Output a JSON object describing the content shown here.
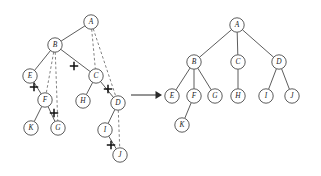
{
  "figure": {
    "background_color": "#ffffff",
    "node_stroke_color": "#4a4a4a",
    "dashed_edge_color": "#6b6b6b",
    "cut_mark_color": "#111111",
    "arrow_color": "#2a2a2a",
    "node_radius": 7.2
  },
  "arrow": {
    "label": "",
    "x1": 131,
    "y1": 95,
    "x2": 162,
    "y2": 95
  },
  "left_tree": {
    "name": "left-tree",
    "nodes": [
      {
        "id": "A",
        "label": "A",
        "x": 91,
        "y": 22
      },
      {
        "id": "B",
        "label": "B",
        "x": 55,
        "y": 45
      },
      {
        "id": "C",
        "label": "C",
        "x": 96,
        "y": 76
      },
      {
        "id": "D",
        "label": "D",
        "x": 118,
        "y": 103
      },
      {
        "id": "E",
        "label": "E",
        "x": 30,
        "y": 76
      },
      {
        "id": "F",
        "label": "F",
        "x": 45,
        "y": 100
      },
      {
        "id": "G",
        "label": "G",
        "x": 58,
        "y": 128
      },
      {
        "id": "H",
        "label": "H",
        "x": 83,
        "y": 101
      },
      {
        "id": "I",
        "label": "I",
        "x": 105,
        "y": 130
      },
      {
        "id": "J",
        "label": "J",
        "x": 120,
        "y": 155
      },
      {
        "id": "K",
        "label": "K",
        "x": 31,
        "y": 128
      }
    ],
    "solid_edges": [
      {
        "from": "A",
        "to": "B"
      },
      {
        "from": "B",
        "to": "E"
      },
      {
        "from": "B",
        "to": "C"
      },
      {
        "from": "E",
        "to": "F"
      },
      {
        "from": "F",
        "to": "K"
      },
      {
        "from": "F",
        "to": "G"
      },
      {
        "from": "C",
        "to": "H"
      },
      {
        "from": "C",
        "to": "D"
      },
      {
        "from": "D",
        "to": "I"
      },
      {
        "from": "I",
        "to": "J"
      }
    ],
    "dashed_edges": [
      {
        "from": "A",
        "to": "C"
      },
      {
        "from": "A",
        "to": "D"
      },
      {
        "from": "B",
        "to": "F"
      },
      {
        "from": "B",
        "to": "G"
      },
      {
        "from": "D",
        "to": "J"
      }
    ],
    "cut_marks": [
      {
        "on_edge": "B-C",
        "x": 74,
        "y": 66
      },
      {
        "on_edge": "E-F",
        "x": 34,
        "y": 87
      },
      {
        "on_edge": "F-G",
        "x": 54,
        "y": 113
      },
      {
        "on_edge": "C-D",
        "x": 108,
        "y": 89
      },
      {
        "on_edge": "I-J",
        "x": 111,
        "y": 145
      }
    ]
  },
  "right_tree": {
    "name": "right-tree",
    "nodes": [
      {
        "id": "A",
        "label": "A",
        "x": 237,
        "y": 25
      },
      {
        "id": "B",
        "label": "B",
        "x": 194,
        "y": 62
      },
      {
        "id": "C",
        "label": "C",
        "x": 238,
        "y": 62
      },
      {
        "id": "D",
        "label": "D",
        "x": 279,
        "y": 62
      },
      {
        "id": "E",
        "label": "E",
        "x": 172,
        "y": 96
      },
      {
        "id": "F",
        "label": "F",
        "x": 194,
        "y": 96
      },
      {
        "id": "G",
        "label": "G",
        "x": 215,
        "y": 96
      },
      {
        "id": "H",
        "label": "H",
        "x": 238,
        "y": 96
      },
      {
        "id": "I",
        "label": "I",
        "x": 266,
        "y": 96
      },
      {
        "id": "J",
        "label": "J",
        "x": 292,
        "y": 96
      },
      {
        "id": "K",
        "label": "K",
        "x": 182,
        "y": 125
      }
    ],
    "solid_edges": [
      {
        "from": "A",
        "to": "B"
      },
      {
        "from": "A",
        "to": "C"
      },
      {
        "from": "A",
        "to": "D"
      },
      {
        "from": "B",
        "to": "E"
      },
      {
        "from": "B",
        "to": "F"
      },
      {
        "from": "B",
        "to": "G"
      },
      {
        "from": "C",
        "to": "H"
      },
      {
        "from": "D",
        "to": "I"
      },
      {
        "from": "D",
        "to": "J"
      },
      {
        "from": "F",
        "to": "K"
      }
    ]
  }
}
